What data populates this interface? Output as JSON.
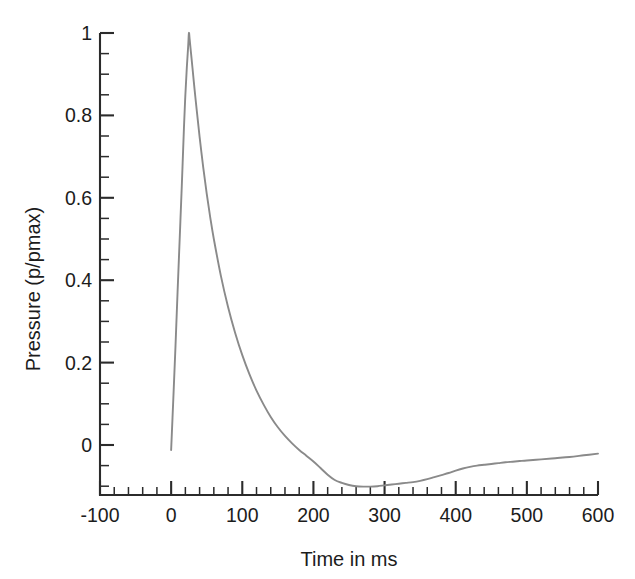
{
  "chart_data": {
    "type": "line",
    "title": "",
    "subtitle": "",
    "xlabel": "Time in ms",
    "ylabel": "Pressure (p/pmax)",
    "xlim": [
      -100,
      600
    ],
    "ylim": [
      -0.135,
      1.0
    ],
    "grid": false,
    "legend": null,
    "legend_position": "none",
    "x_ticks": [
      -100,
      0,
      100,
      200,
      300,
      400,
      500,
      600
    ],
    "x_tick_labels": [
      "-100",
      "0",
      "100",
      "200",
      "300",
      "400",
      "500",
      "600"
    ],
    "x_minor_tick_interval": 20,
    "y_ticks": [
      0,
      0.2,
      0.4,
      0.6,
      0.8,
      1
    ],
    "y_tick_labels": [
      "0",
      "0.2",
      "0.4",
      "0.6",
      "0.8",
      "1"
    ],
    "y_minor_tick_interval": 0.05,
    "series": [
      {
        "name": "Blast overpressure",
        "color": "#8a8a8a",
        "x": [
          0,
          3,
          6,
          9,
          12,
          15,
          18,
          20,
          22,
          24,
          25,
          26,
          28,
          30,
          33,
          36,
          40,
          45,
          50,
          55,
          60,
          70,
          80,
          90,
          100,
          110,
          120,
          130,
          140,
          150,
          160,
          170,
          180,
          190,
          200,
          210,
          220,
          230,
          240,
          250,
          260,
          270,
          280,
          290,
          300,
          310,
          320,
          330,
          340,
          350,
          360,
          370,
          380,
          390,
          400,
          410,
          420,
          430,
          440,
          450,
          460,
          470,
          480,
          490,
          500,
          520,
          540,
          560,
          580,
          600
        ],
        "y": [
          -0.012,
          0.11,
          0.235,
          0.37,
          0.5,
          0.63,
          0.77,
          0.85,
          0.915,
          0.97,
          1.0,
          0.985,
          0.95,
          0.915,
          0.862,
          0.812,
          0.748,
          0.675,
          0.61,
          0.552,
          0.5,
          0.41,
          0.335,
          0.272,
          0.218,
          0.172,
          0.132,
          0.098,
          0.068,
          0.043,
          0.022,
          0.004,
          -0.012,
          -0.026,
          -0.04,
          -0.056,
          -0.072,
          -0.085,
          -0.092,
          -0.097,
          -0.1,
          -0.101,
          -0.101,
          -0.1,
          -0.098,
          -0.096,
          -0.094,
          -0.092,
          -0.09,
          -0.087,
          -0.083,
          -0.078,
          -0.073,
          -0.068,
          -0.062,
          -0.057,
          -0.053,
          -0.05,
          -0.048,
          -0.046,
          -0.044,
          -0.042,
          -0.0405,
          -0.039,
          -0.0375,
          -0.035,
          -0.032,
          -0.029,
          -0.025,
          -0.021
        ]
      }
    ],
    "annotations": []
  },
  "axes": {
    "y_axis_title": "Pressure (p/pmax)",
    "x_axis_title": "Time in ms"
  }
}
